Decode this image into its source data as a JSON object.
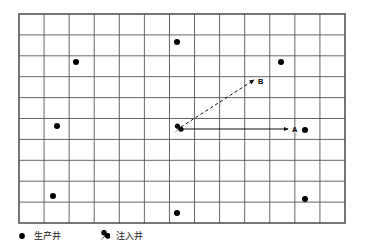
{
  "figure": {
    "title": "",
    "background_color": "#ffffff",
    "line_color": "#3a3a3a",
    "marker_color": "#000000"
  },
  "grid": {
    "x": 19,
    "y": 14,
    "width": 326,
    "height": 209,
    "columns": 13,
    "rows": 10,
    "cell_width": 25.08,
    "cell_height": 20.9,
    "border_color": "#4a4a4a",
    "line_color": "#555555"
  },
  "chart_data": {
    "type": "scatter",
    "title": "",
    "xlabel": "",
    "ylabel": "",
    "grid": true,
    "legend_position": "bottom-left",
    "series": [
      {
        "name": "生产井",
        "marker": "filled-circle",
        "color": "#000000",
        "points": [
          {
            "x": 177,
            "y": 42
          },
          {
            "x": 76,
            "y": 62
          },
          {
            "x": 281,
            "y": 62
          },
          {
            "x": 57,
            "y": 126
          },
          {
            "x": 305,
            "y": 130
          },
          {
            "x": 53,
            "y": 196
          },
          {
            "x": 305,
            "y": 199
          },
          {
            "x": 177,
            "y": 213
          }
        ]
      },
      {
        "name": "注入井",
        "marker": "teardrop",
        "color": "#000000",
        "points": [
          {
            "x": 178,
            "y": 129
          }
        ]
      }
    ],
    "annotations": [
      {
        "label": "A",
        "type": "arrow-solid",
        "x1": 181,
        "y1": 129,
        "x2": 288,
        "y2": 129,
        "label_x": 292,
        "label_y": 126
      },
      {
        "label": "B",
        "type": "arrow-dashed",
        "x1": 181,
        "y1": 127,
        "x2": 254,
        "y2": 80,
        "label_x": 258,
        "label_y": 78
      }
    ]
  },
  "legend": {
    "entries": [
      {
        "label": "生产井",
        "marker": "filled-circle",
        "x": 16,
        "y": 2
      },
      {
        "label": "注入井",
        "marker": "teardrop",
        "x": 98,
        "y": 2
      }
    ]
  }
}
